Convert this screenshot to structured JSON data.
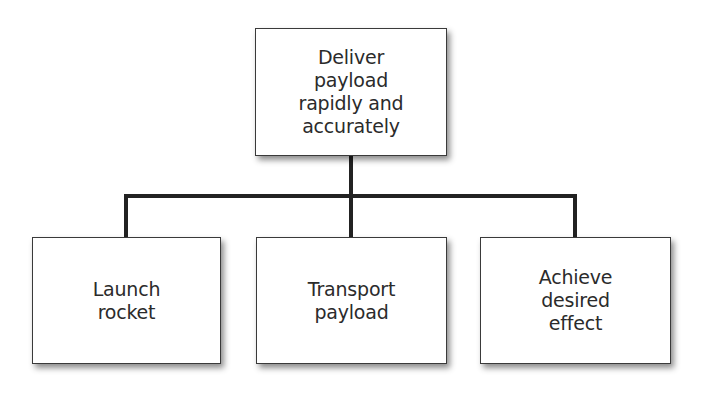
{
  "diagram": {
    "type": "hierarchy",
    "root": {
      "label": "Deliver payload rapidly and accurately",
      "lines": [
        "Deliver",
        "payload",
        "rapidly and",
        "accurately"
      ]
    },
    "children": [
      {
        "label": "Launch rocket",
        "lines": [
          "Launch",
          "rocket"
        ]
      },
      {
        "label": "Transport payload",
        "lines": [
          "Transport",
          "payload"
        ]
      },
      {
        "label": "Achieve desired effect",
        "lines": [
          "Achieve",
          "desired",
          "effect"
        ]
      }
    ],
    "colors": {
      "connector": "#222222",
      "box_border": "#3a3a3a",
      "text": "#2b2b2b",
      "background": "#ffffff"
    }
  }
}
